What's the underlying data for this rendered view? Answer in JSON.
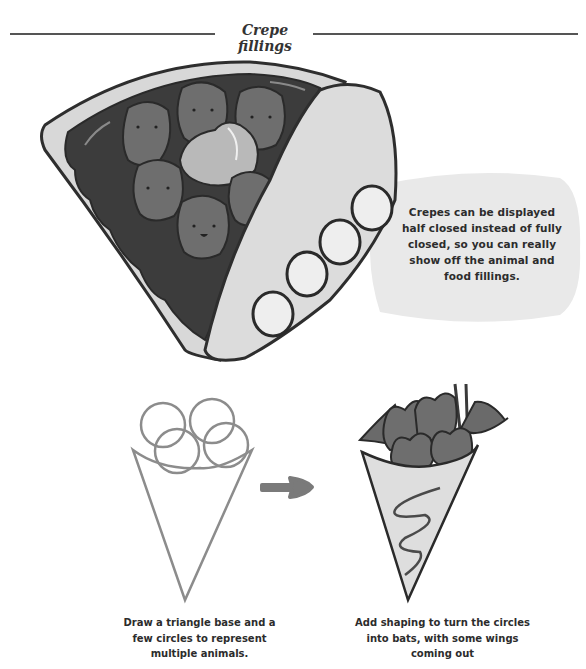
{
  "header": {
    "title": "Crepe fillings"
  },
  "callout": {
    "text": "Crepes can be displayed half closed instead of fully closed, so you can really show off the animal and food fillings."
  },
  "steps": [
    {
      "illustration": "sketch-cone-with-circles",
      "caption": "Draw a triangle base and a few circles to represent multiple animals."
    },
    {
      "illustration": "finished-cone-with-bat-cats",
      "caption": "Add shaping to turn the circles into bats, with some wings coming out"
    }
  ],
  "illustrations": {
    "main": "half-closed-crepe-with-strawberry-animals-cream-and-banana-slices",
    "arrow": "arrow-right-icon"
  },
  "colors": {
    "line": "#333333",
    "chocolate": "#3a3a3a",
    "strawberry": "#6e6e6e",
    "crepe": "#d9d9d9",
    "bubble": "#e8e8e8",
    "sketch": "#8c8c8c"
  }
}
